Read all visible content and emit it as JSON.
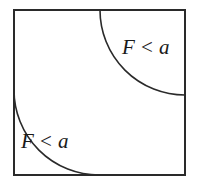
{
  "figure": {
    "type": "geometric-diagram",
    "background_color": "#ffffff",
    "stroke_color": "#2a2a2a",
    "border": {
      "name": "square-outline",
      "x": 14,
      "y": 10,
      "width": 171,
      "height": 165,
      "stroke_width": 2
    },
    "arcs": [
      {
        "name": "top-right-arc",
        "center_x": 185,
        "center_y": 10,
        "radius": 85,
        "stroke_width": 1.6,
        "start_point": [
          100,
          10
        ],
        "end_point": [
          185,
          95
        ]
      },
      {
        "name": "bottom-left-arc",
        "center_x": 14,
        "center_y": 175,
        "radius": 85,
        "stroke_width": 1.6,
        "start_point": [
          14,
          90
        ],
        "end_point": [
          99,
          175
        ]
      }
    ],
    "labels": [
      {
        "name": "top-right-region-label",
        "variable": "F",
        "operator": "<",
        "bound": "a",
        "text": "F < a",
        "x": 122,
        "y": 54
      },
      {
        "name": "bottom-left-region-label",
        "variable": "F",
        "operator": "<",
        "bound": "a",
        "text": "F < a",
        "x": 21,
        "y": 148
      }
    ]
  }
}
